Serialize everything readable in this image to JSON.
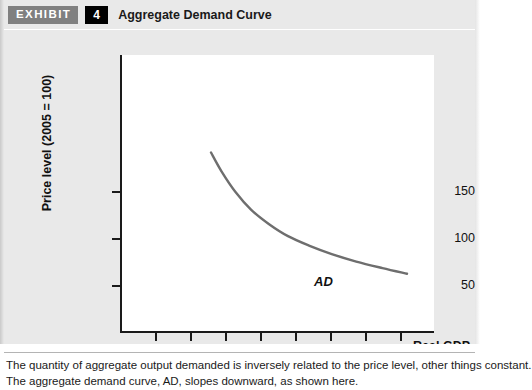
{
  "header": {
    "exhibit_tag": "EXHIBIT",
    "exhibit_number": "4",
    "title": "Aggregate Demand Curve"
  },
  "colors": {
    "background": "#e9e9e9",
    "panel": "#ffffff",
    "axis": "#1a1a1a",
    "curve": "#6e6e6e",
    "tag_background": "#808080",
    "number_background": "#000000"
  },
  "caption": {
    "line1": "The quantity of aggregate output demanded is inversely related to the price level, other things constant.",
    "line2": "The aggregate demand curve, AD, slopes downward, as shown here."
  },
  "chart_data": {
    "type": "line",
    "title": "Aggregate Demand Curve",
    "xlabel_line1": "Real GDP",
    "xlabel_line2": "(trillions of 2005 dollars)",
    "ylabel": "Price level (2005 = 100)",
    "origin_label": "0",
    "xticks": [
      2,
      4,
      6,
      8,
      10,
      12,
      14,
      16
    ],
    "xtick_labels": [
      "2",
      "4",
      "6",
      "8",
      "10",
      "12",
      "14",
      "16"
    ],
    "yticks": [
      50,
      100,
      150
    ],
    "ytick_labels": [
      "50",
      "100",
      "150"
    ],
    "xlim": [
      0,
      18
    ],
    "ylim": [
      0,
      200
    ],
    "grid": false,
    "legend": "none",
    "series": [
      {
        "name": "AD",
        "label": "AD",
        "annotation": "AD",
        "x": [
          5.2,
          5.8,
          6.6,
          7.5,
          8.5,
          9.6,
          10.8,
          12.1,
          13.5,
          15.0,
          16.4
        ],
        "y": [
          192,
          172,
          150,
          131,
          116,
          103,
          93,
          84,
          76,
          69,
          63
        ]
      }
    ]
  }
}
